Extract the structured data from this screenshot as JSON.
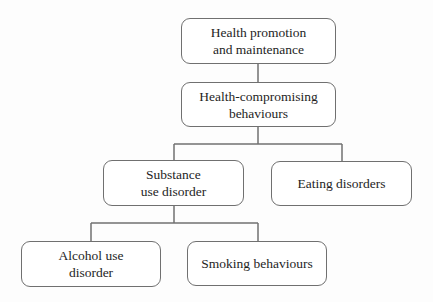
{
  "diagram": {
    "type": "hierarchy-tree",
    "nodes": [
      {
        "id": "n1",
        "label": "Health promotion\nand maintenance"
      },
      {
        "id": "n2",
        "label": "Health-compromising\nbehaviours"
      },
      {
        "id": "n3",
        "label": "Substance\nuse disorder"
      },
      {
        "id": "n4",
        "label": "Eating disorders"
      },
      {
        "id": "n5",
        "label": "Alcohol use\ndisorder"
      },
      {
        "id": "n6",
        "label": "Smoking behaviours"
      }
    ],
    "edges": [
      {
        "from": "n1",
        "to": "n2"
      },
      {
        "from": "n2",
        "to": "n3"
      },
      {
        "from": "n2",
        "to": "n4"
      },
      {
        "from": "n3",
        "to": "n5"
      },
      {
        "from": "n3",
        "to": "n6"
      }
    ]
  },
  "colors": {
    "border": "#707070",
    "text": "#1e1e1e",
    "background": "#fdfdfd"
  }
}
